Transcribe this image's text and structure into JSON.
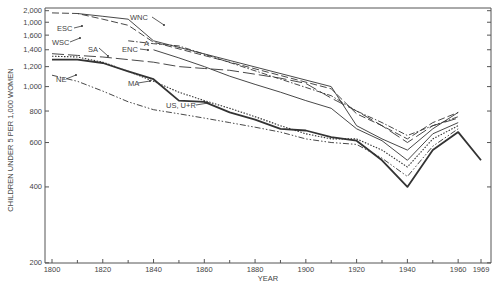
{
  "chart_data": {
    "type": "line",
    "title": "",
    "xlabel": "YEAR",
    "ylabel": "CHILDREN UNDER 5 PER 1,000 WOMEN",
    "yscale": "log",
    "ylim": [
      200,
      2000
    ],
    "xlim": [
      1800,
      1969
    ],
    "y_tick_labels": [
      "2,000",
      "1,000",
      "1,600",
      "1,400",
      "1,200",
      "1,000",
      "800",
      "600",
      "400",
      "200"
    ],
    "y_tick_values": [
      2000,
      1800,
      1600,
      1400,
      1200,
      1000,
      800,
      600,
      400,
      200
    ],
    "x_tick_labels": [
      "1800",
      "1820",
      "1840",
      "1860",
      "1880",
      "1900",
      "1920",
      "1940",
      "1960",
      "1969"
    ],
    "x_tick_values": [
      1800,
      1820,
      1840,
      1860,
      1880,
      1900,
      1920,
      1940,
      1960,
      1969
    ],
    "x_minor_ticks": [
      1810,
      1830,
      1850,
      1870,
      1890,
      1910,
      1930,
      1950
    ],
    "grid": false,
    "legend": "inline labels",
    "series": [
      {
        "name": "WNC",
        "style": "solid-thin",
        "x": [
          1810,
          1820,
          1830,
          1840,
          1910,
          1920,
          1930,
          1940,
          1950,
          1960
        ],
        "values": [
          1950,
          1900,
          1850,
          1520,
          1000,
          700,
          620,
          560,
          680,
          790
        ]
      },
      {
        "name": "ESC",
        "style": "dash",
        "x": [
          1800,
          1810,
          1820,
          1830,
          1840,
          1910,
          1920,
          1930,
          1940,
          1950,
          1960
        ],
        "values": [
          1960,
          1950,
          1850,
          1750,
          1500,
          980,
          780,
          700,
          620,
          720,
          790
        ]
      },
      {
        "name": "WSC",
        "style": "dash-dot",
        "x": [
          1830,
          1840,
          1850,
          1910,
          1920,
          1930,
          1940,
          1950,
          1960
        ],
        "values": [
          1520,
          1480,
          1450,
          920,
          800,
          720,
          640,
          700,
          760
        ]
      },
      {
        "name": "SA",
        "style": "long-dash",
        "x": [
          1800,
          1810,
          1820,
          1830,
          1840,
          1850,
          1860,
          1870,
          1880,
          1890,
          1900,
          1910,
          1920,
          1930,
          1940,
          1950,
          1960
        ],
        "values": [
          1350,
          1330,
          1310,
          1280,
          1250,
          1200,
          1180,
          1160,
          1120,
          1080,
          1030,
          900,
          800,
          700,
          600,
          700,
          750
        ]
      },
      {
        "name": "ENC",
        "style": "solid-thin",
        "x": [
          1840,
          1850,
          1860,
          1870,
          1880,
          1890,
          1900,
          1910,
          1920,
          1930,
          1940,
          1950,
          1960
        ],
        "values": [
          1400,
          1300,
          1200,
          1100,
          1020,
          950,
          880,
          820,
          680,
          610,
          510,
          650,
          720
        ]
      },
      {
        "name": "MA",
        "style": "dotted",
        "x": [
          1800,
          1810,
          1820,
          1830,
          1840,
          1850,
          1860,
          1870,
          1880,
          1890,
          1900,
          1910,
          1920,
          1930,
          1940,
          1950,
          1960
        ],
        "values": [
          1320,
          1310,
          1250,
          1150,
          1050,
          950,
          880,
          820,
          760,
          700,
          650,
          620,
          620,
          560,
          480,
          620,
          700
        ]
      },
      {
        "name": "NE",
        "style": "dash-dot-dot",
        "x": [
          1800,
          1810,
          1820,
          1830,
          1840,
          1850,
          1860,
          1870,
          1880,
          1890,
          1900,
          1910,
          1920,
          1930,
          1940,
          1950,
          1960
        ],
        "values": [
          1110,
          1050,
          960,
          870,
          810,
          780,
          750,
          720,
          690,
          660,
          620,
          600,
          590,
          520,
          440,
          580,
          680
        ]
      },
      {
        "name": "US, U+R",
        "style": "solid-thick",
        "x": [
          1800,
          1810,
          1820,
          1830,
          1840,
          1850,
          1860,
          1870,
          1880,
          1890,
          1900,
          1910,
          1920,
          1930,
          1940,
          1950,
          1960,
          1969
        ],
        "values": [
          1280,
          1280,
          1240,
          1150,
          1070,
          880,
          870,
          790,
          740,
          680,
          670,
          630,
          610,
          510,
          400,
          560,
          660,
          510
        ]
      }
    ],
    "annotations": [
      "WNC",
      "ESC",
      "WSC",
      "SA",
      "ENC",
      "MA",
      "NE",
      "US, U+R",
      "A"
    ]
  }
}
